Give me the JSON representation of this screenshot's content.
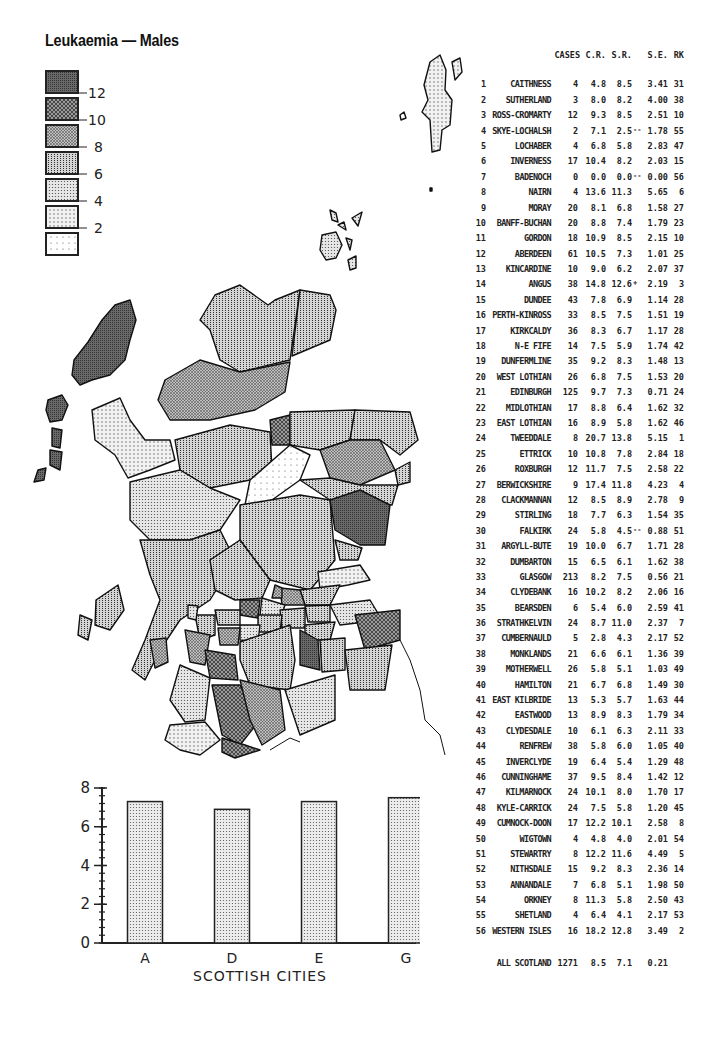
{
  "title": "Leukaemia — Males",
  "legend": {
    "items": [
      {
        "label": "12",
        "fill": "p12"
      },
      {
        "label": "10",
        "fill": "p10"
      },
      {
        "label": "8",
        "fill": "p8"
      },
      {
        "label": "6",
        "fill": "p6"
      },
      {
        "label": "4",
        "fill": "p4"
      },
      {
        "label": "2",
        "fill": "p2"
      },
      {
        "label": "",
        "fill": "p0"
      }
    ]
  },
  "table": {
    "headers": {
      "cases": "CASES",
      "cr": "C.R.",
      "sr": "S.R.",
      "se": "S.E.",
      "rk": "RK"
    },
    "rows": [
      {
        "n": "1",
        "name": "CAITHNESS",
        "cases": "4",
        "cr": "4.8",
        "sr": "8.5",
        "flag": "",
        "se": "3.41",
        "rk": "31"
      },
      {
        "n": "2",
        "name": "SUTHERLAND",
        "cases": "3",
        "cr": "8.0",
        "sr": "8.2",
        "flag": "",
        "se": "4.00",
        "rk": "38"
      },
      {
        "n": "3",
        "name": "ROSS-CROMARTY",
        "cases": "12",
        "cr": "9.3",
        "sr": "8.5",
        "flag": "",
        "se": "2.51",
        "rk": "10"
      },
      {
        "n": "4",
        "name": "SKYE-LOCHALSH",
        "cases": "2",
        "cr": "7.1",
        "sr": "2.5",
        "flag": "--",
        "se": "1.78",
        "rk": "55"
      },
      {
        "n": "5",
        "name": "LOCHABER",
        "cases": "4",
        "cr": "6.8",
        "sr": "5.8",
        "flag": "",
        "se": "2.83",
        "rk": "47"
      },
      {
        "n": "6",
        "name": "INVERNESS",
        "cases": "17",
        "cr": "10.4",
        "sr": "8.2",
        "flag": "",
        "se": "2.03",
        "rk": "15"
      },
      {
        "n": "7",
        "name": "BADENOCH",
        "cases": "0",
        "cr": "0.0",
        "sr": "0.0",
        "flag": "--",
        "se": "0.00",
        "rk": "56"
      },
      {
        "n": "8",
        "name": "NAIRN",
        "cases": "4",
        "cr": "13.6",
        "sr": "11.3",
        "flag": "",
        "se": "5.65",
        "rk": "6"
      },
      {
        "n": "9",
        "name": "MORAY",
        "cases": "20",
        "cr": "8.1",
        "sr": "6.8",
        "flag": "",
        "se": "1.58",
        "rk": "27"
      },
      {
        "n": "10",
        "name": "BANFF-BUCHAN",
        "cases": "20",
        "cr": "8.8",
        "sr": "7.4",
        "flag": "",
        "se": "1.79",
        "rk": "23"
      },
      {
        "n": "11",
        "name": "GORDON",
        "cases": "18",
        "cr": "10.9",
        "sr": "8.5",
        "flag": "",
        "se": "2.15",
        "rk": "10"
      },
      {
        "n": "12",
        "name": "ABERDEEN",
        "cases": "61",
        "cr": "10.5",
        "sr": "7.3",
        "flag": "",
        "se": "1.01",
        "rk": "25"
      },
      {
        "n": "13",
        "name": "KINCARDINE",
        "cases": "10",
        "cr": "9.0",
        "sr": "6.2",
        "flag": "",
        "se": "2.07",
        "rk": "37"
      },
      {
        "n": "14",
        "name": "ANGUS",
        "cases": "38",
        "cr": "14.8",
        "sr": "12.6",
        "flag": "+",
        "se": "2.19",
        "rk": "3"
      },
      {
        "n": "15",
        "name": "DUNDEE",
        "cases": "43",
        "cr": "7.8",
        "sr": "6.9",
        "flag": "",
        "se": "1.14",
        "rk": "28"
      },
      {
        "n": "16",
        "name": "PERTH-KINROSS",
        "cases": "33",
        "cr": "8.5",
        "sr": "7.5",
        "flag": "",
        "se": "1.51",
        "rk": "19"
      },
      {
        "n": "17",
        "name": "KIRKCALDY",
        "cases": "36",
        "cr": "8.3",
        "sr": "6.7",
        "flag": "",
        "se": "1.17",
        "rk": "28"
      },
      {
        "n": "18",
        "name": "N-E FIFE",
        "cases": "14",
        "cr": "7.5",
        "sr": "5.9",
        "flag": "",
        "se": "1.74",
        "rk": "42"
      },
      {
        "n": "19",
        "name": "DUNFERMLINE",
        "cases": "35",
        "cr": "9.2",
        "sr": "8.3",
        "flag": "",
        "se": "1.48",
        "rk": "13"
      },
      {
        "n": "20",
        "name": "WEST LOTHIAN",
        "cases": "26",
        "cr": "6.8",
        "sr": "7.5",
        "flag": "",
        "se": "1.53",
        "rk": "20"
      },
      {
        "n": "21",
        "name": "EDINBURGH",
        "cases": "125",
        "cr": "9.7",
        "sr": "7.3",
        "flag": "",
        "se": "0.71",
        "rk": "24"
      },
      {
        "n": "22",
        "name": "MIDLOTHIAN",
        "cases": "17",
        "cr": "8.8",
        "sr": "6.4",
        "flag": "",
        "se": "1.62",
        "rk": "32"
      },
      {
        "n": "23",
        "name": "EAST LOTHIAN",
        "cases": "16",
        "cr": "8.9",
        "sr": "5.8",
        "flag": "",
        "se": "1.62",
        "rk": "46"
      },
      {
        "n": "24",
        "name": "TWEEDDALE",
        "cases": "8",
        "cr": "20.7",
        "sr": "13.8",
        "flag": "",
        "se": "5.15",
        "rk": "1"
      },
      {
        "n": "25",
        "name": "ETTRICK",
        "cases": "10",
        "cr": "10.8",
        "sr": "7.8",
        "flag": "",
        "se": "2.84",
        "rk": "18"
      },
      {
        "n": "26",
        "name": "ROXBURGH",
        "cases": "12",
        "cr": "11.7",
        "sr": "7.5",
        "flag": "",
        "se": "2.58",
        "rk": "22"
      },
      {
        "n": "27",
        "name": "BERWICKSHIRE",
        "cases": "9",
        "cr": "17.4",
        "sr": "11.8",
        "flag": "",
        "se": "4.23",
        "rk": "4"
      },
      {
        "n": "28",
        "name": "CLACKMANNAN",
        "cases": "12",
        "cr": "8.5",
        "sr": "8.9",
        "flag": "",
        "se": "2.78",
        "rk": "9"
      },
      {
        "n": "29",
        "name": "STIRLING",
        "cases": "18",
        "cr": "7.7",
        "sr": "6.3",
        "flag": "",
        "se": "1.54",
        "rk": "35"
      },
      {
        "n": "30",
        "name": "FALKIRK",
        "cases": "24",
        "cr": "5.8",
        "sr": "4.5",
        "flag": "--",
        "se": "0.88",
        "rk": "51"
      },
      {
        "n": "31",
        "name": "ARGYLL-BUTE",
        "cases": "19",
        "cr": "10.0",
        "sr": "6.7",
        "flag": "",
        "se": "1.71",
        "rk": "28"
      },
      {
        "n": "32",
        "name": "DUMBARTON",
        "cases": "15",
        "cr": "6.5",
        "sr": "6.1",
        "flag": "",
        "se": "1.62",
        "rk": "38"
      },
      {
        "n": "33",
        "name": "GLASGOW",
        "cases": "213",
        "cr": "8.2",
        "sr": "7.5",
        "flag": "",
        "se": "0.56",
        "rk": "21"
      },
      {
        "n": "34",
        "name": "CLYDEBANK",
        "cases": "16",
        "cr": "10.2",
        "sr": "8.2",
        "flag": "",
        "se": "2.06",
        "rk": "16"
      },
      {
        "n": "35",
        "name": "BEARSDEN",
        "cases": "6",
        "cr": "5.4",
        "sr": "6.0",
        "flag": "",
        "se": "2.59",
        "rk": "41"
      },
      {
        "n": "36",
        "name": "STRATHKELVIN",
        "cases": "24",
        "cr": "8.7",
        "sr": "11.0",
        "flag": "",
        "se": "2.37",
        "rk": "7"
      },
      {
        "n": "37",
        "name": "CUMBERNAULD",
        "cases": "5",
        "cr": "2.8",
        "sr": "4.3",
        "flag": "",
        "se": "2.17",
        "rk": "52"
      },
      {
        "n": "38",
        "name": "MONKLANDS",
        "cases": "21",
        "cr": "6.6",
        "sr": "6.1",
        "flag": "",
        "se": "1.36",
        "rk": "39"
      },
      {
        "n": "39",
        "name": "MOTHERWELL",
        "cases": "26",
        "cr": "5.8",
        "sr": "5.1",
        "flag": "",
        "se": "1.03",
        "rk": "49"
      },
      {
        "n": "40",
        "name": "HAMILTON",
        "cases": "21",
        "cr": "6.7",
        "sr": "6.8",
        "flag": "",
        "se": "1.49",
        "rk": "30"
      },
      {
        "n": "41",
        "name": "EAST KILBRIDE",
        "cases": "13",
        "cr": "5.3",
        "sr": "5.7",
        "flag": "",
        "se": "1.63",
        "rk": "44"
      },
      {
        "n": "42",
        "name": "EASTWOOD",
        "cases": "13",
        "cr": "8.9",
        "sr": "8.3",
        "flag": "",
        "se": "1.79",
        "rk": "34"
      },
      {
        "n": "43",
        "name": "CLYDESDALE",
        "cases": "10",
        "cr": "6.1",
        "sr": "6.3",
        "flag": "",
        "se": "2.11",
        "rk": "33"
      },
      {
        "n": "44",
        "name": "RENFREW",
        "cases": "38",
        "cr": "5.8",
        "sr": "6.0",
        "flag": "",
        "se": "1.05",
        "rk": "40"
      },
      {
        "n": "45",
        "name": "INVERCLYDE",
        "cases": "19",
        "cr": "6.4",
        "sr": "5.4",
        "flag": "",
        "se": "1.29",
        "rk": "48"
      },
      {
        "n": "46",
        "name": "CUNNINGHAME",
        "cases": "37",
        "cr": "9.5",
        "sr": "8.4",
        "flag": "",
        "se": "1.42",
        "rk": "12"
      },
      {
        "n": "47",
        "name": "KILMARNOCK",
        "cases": "24",
        "cr": "10.1",
        "sr": "8.0",
        "flag": "",
        "se": "1.70",
        "rk": "17"
      },
      {
        "n": "48",
        "name": "KYLE-CARRICK",
        "cases": "24",
        "cr": "7.5",
        "sr": "5.8",
        "flag": "",
        "se": "1.20",
        "rk": "45"
      },
      {
        "n": "49",
        "name": "CUMNOCK-DOON",
        "cases": "17",
        "cr": "12.2",
        "sr": "10.1",
        "flag": "",
        "se": "2.58",
        "rk": "8"
      },
      {
        "n": "50",
        "name": "WIGTOWN",
        "cases": "4",
        "cr": "4.8",
        "sr": "4.0",
        "flag": "",
        "se": "2.01",
        "rk": "54"
      },
      {
        "n": "51",
        "name": "STEWARTRY",
        "cases": "8",
        "cr": "12.2",
        "sr": "11.6",
        "flag": "",
        "se": "4.49",
        "rk": "5"
      },
      {
        "n": "52",
        "name": "NITHSDALE",
        "cases": "15",
        "cr": "9.2",
        "sr": "8.3",
        "flag": "",
        "se": "2.36",
        "rk": "14"
      },
      {
        "n": "53",
        "name": "ANNANDALE",
        "cases": "7",
        "cr": "6.8",
        "sr": "5.1",
        "flag": "",
        "se": "1.98",
        "rk": "50"
      },
      {
        "n": "54",
        "name": "ORKNEY",
        "cases": "8",
        "cr": "11.3",
        "sr": "5.8",
        "flag": "",
        "se": "2.50",
        "rk": "43"
      },
      {
        "n": "55",
        "name": "SHETLAND",
        "cases": "4",
        "cr": "6.4",
        "sr": "4.1",
        "flag": "",
        "se": "2.17",
        "rk": "53"
      },
      {
        "n": "56",
        "name": "WESTERN ISLES",
        "cases": "16",
        "cr": "18.2",
        "sr": "12.8",
        "flag": "",
        "se": "3.49",
        "rk": "2"
      }
    ],
    "total": {
      "name": "ALL SCOTLAND",
      "cases": "1271",
      "cr": "8.5",
      "sr": "7.1",
      "se": "0.21"
    }
  },
  "bar_chart": {
    "xlabel": "SCOTTISH CITIES",
    "y_ticks": [
      "0",
      "2",
      "4",
      "6",
      "8"
    ]
  },
  "chart_data": [
    {
      "type": "bar",
      "title": "",
      "categories": [
        "A",
        "D",
        "E",
        "G"
      ],
      "values": [
        7.3,
        6.9,
        7.3,
        7.5
      ],
      "xlabel": "SCOTTISH CITIES",
      "ylabel": "",
      "ylim": [
        0,
        8
      ],
      "y_major_ticks": [
        0,
        2,
        4,
        6,
        8
      ],
      "grid": false
    },
    {
      "type": "table",
      "title": "Leukaemia — Males",
      "columns": [
        "#",
        "District",
        "CASES",
        "C.R.",
        "S.R.",
        "S.E.",
        "RK"
      ],
      "note": "Rows listed in #page-data.table.rows; choropleth map legend classes by S.R.: <2, 2-4, 4-6, 6-8, 8-10, 10-12, >12"
    }
  ]
}
